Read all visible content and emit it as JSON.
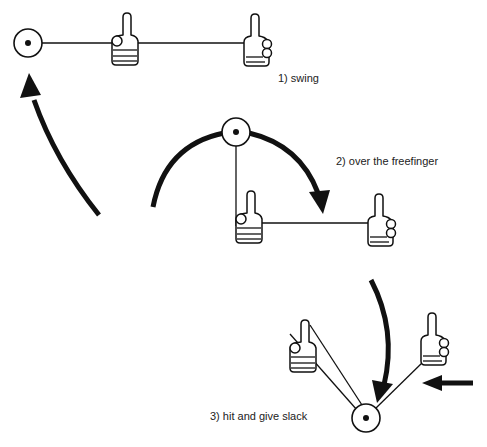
{
  "steps": [
    {
      "number": 1,
      "label": "1) swing"
    },
    {
      "number": 2,
      "label": "2) over the freefinger"
    },
    {
      "number": 3,
      "label": "3) hit and give slack"
    }
  ],
  "icons": {
    "pivot": "pivot-circle-icon",
    "hand": "thumbs-up-hand-icon",
    "arrow": "curved-arrow-icon"
  },
  "colors": {
    "ink": "#111111",
    "text": "#222222",
    "background": "#ffffff"
  }
}
